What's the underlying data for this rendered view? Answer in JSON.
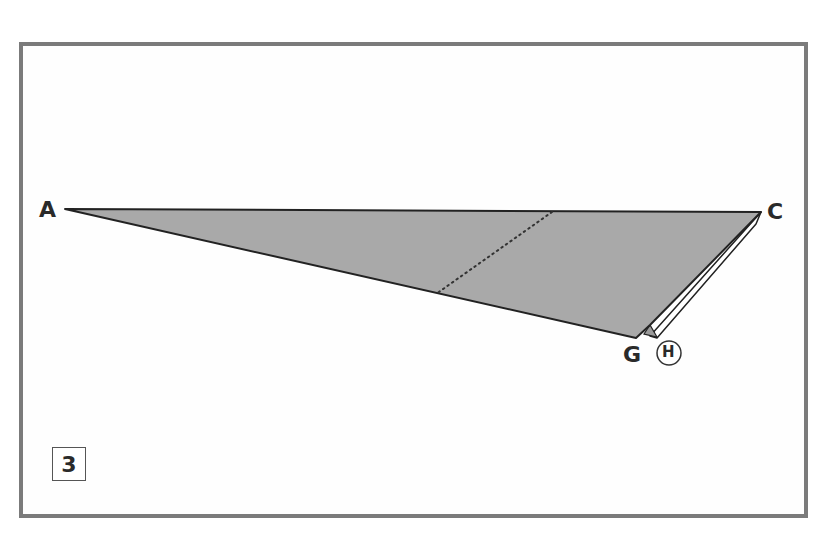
{
  "diagram": {
    "type": "origami-fold-step",
    "step_number": "3",
    "labels": {
      "a": "A",
      "c": "C",
      "g": "G",
      "h": "H"
    },
    "circled_label": "H",
    "colors": {
      "frame_border": "#7b7b7b",
      "paper_fill": "#a8a8a8",
      "edge": "#222222",
      "background": "#fefefe"
    },
    "fold_lines": [
      {
        "style": "dotted",
        "kind": "valley-fold"
      }
    ]
  }
}
